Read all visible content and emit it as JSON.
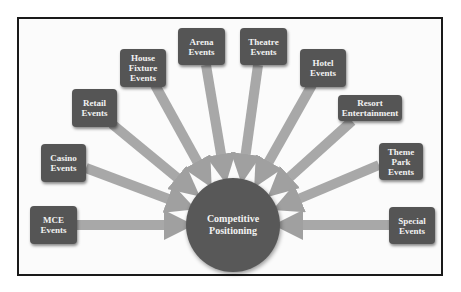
{
  "diagram": {
    "type": "hub-and-spoke",
    "center": {
      "label": "Competitive\nPositioning"
    },
    "nodes": [
      {
        "id": "mce",
        "label": "MCE\nEvents"
      },
      {
        "id": "casino",
        "label": "Casino\nEvents"
      },
      {
        "id": "retail",
        "label": "Retail\nEvents"
      },
      {
        "id": "house-fixture",
        "label": "House\nFixture\nEvents"
      },
      {
        "id": "arena",
        "label": "Arena\nEvents"
      },
      {
        "id": "theatre",
        "label": "Theatre\nEvents"
      },
      {
        "id": "hotel",
        "label": "Hotel\nEvents"
      },
      {
        "id": "resort",
        "label": "Resort\nEntertainment"
      },
      {
        "id": "theme-park",
        "label": "Theme\nPark\nEvents"
      },
      {
        "id": "special",
        "label": "Special\nEvents"
      }
    ],
    "edge_direction": "node-to-center",
    "colors": {
      "node_fill": "#555555",
      "hub_fill": "#585858",
      "arrow_fill": "#a8a8a8",
      "text": "#f2f2f2",
      "frame": "#1a1a1a"
    }
  }
}
